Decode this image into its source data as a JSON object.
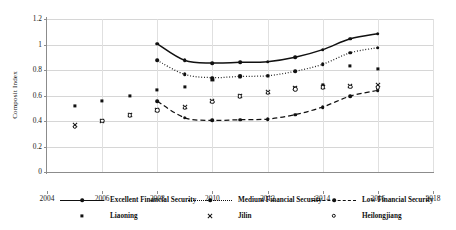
{
  "chart_data": {
    "type": "line",
    "title": "",
    "subtitle": "",
    "xlabel": "",
    "ylabel": "Composit Index",
    "xlim": [
      2004,
      2018
    ],
    "ylim": [
      0,
      1.2
    ],
    "xticks": [
      "2004",
      "2006",
      "2008",
      "2010",
      "2012",
      "2014",
      "2016",
      "2018"
    ],
    "yticks": [
      "0",
      "0.2",
      "0.4",
      "0.6",
      "0.8",
      "1",
      "1.2"
    ],
    "grid": "horizontal-and-vertical",
    "legend_position": "bottom",
    "x": [
      2005,
      2006,
      2007,
      2008,
      2009,
      2010,
      2011,
      2012,
      2013,
      2014,
      2015,
      2016
    ],
    "series": [
      {
        "name": "Excellent Financial Security",
        "marker": "filled-circle",
        "line": "solid",
        "x": [
          2008,
          2009,
          2010,
          2011,
          2012,
          2013,
          2014,
          2015,
          2016
        ],
        "values": [
          1.005,
          0.875,
          0.855,
          0.86,
          0.865,
          0.9,
          0.96,
          1.045,
          1.085
        ]
      },
      {
        "name": "Medium Financial Security",
        "marker": "filled-circle",
        "line": "dotted",
        "x": [
          2008,
          2009,
          2010,
          2011,
          2012,
          2013,
          2014,
          2015,
          2016
        ],
        "values": [
          0.875,
          0.765,
          0.74,
          0.75,
          0.755,
          0.79,
          0.845,
          0.935,
          0.975
        ]
      },
      {
        "name": "Low Financial Security",
        "marker": "filled-circle",
        "line": "dashed",
        "x": [
          2008,
          2009,
          2010,
          2011,
          2012,
          2013,
          2014,
          2015,
          2016
        ],
        "values": [
          0.555,
          0.425,
          0.405,
          0.41,
          0.415,
          0.45,
          0.51,
          0.595,
          0.64
        ]
      },
      {
        "name": "Liaoning",
        "marker": "filled-square",
        "line": "none",
        "x": [
          2005,
          2006,
          2007,
          2008,
          2009,
          2010,
          2011,
          2012,
          2013,
          2014,
          2015,
          2016
        ],
        "values": [
          0.52,
          0.555,
          0.6,
          0.645,
          0.67,
          0.72,
          0.75,
          0.755,
          0.655,
          0.685,
          0.835,
          0.81
        ]
      },
      {
        "name": "Jilin",
        "marker": "x",
        "line": "none",
        "x": [
          2005,
          2006,
          2007,
          2008,
          2009,
          2010,
          2011,
          2012,
          2013,
          2014,
          2015,
          2016
        ],
        "values": [
          0.365,
          0.4,
          0.45,
          0.49,
          0.51,
          0.56,
          0.6,
          0.625,
          0.655,
          0.67,
          0.675,
          0.68
        ]
      },
      {
        "name": "Heilongjiang",
        "marker": "open-circle",
        "line": "none",
        "x": [
          2005,
          2006,
          2007,
          2008,
          2009,
          2010,
          2011,
          2012,
          2013,
          2014,
          2015,
          2016
        ],
        "values": [
          0.355,
          0.4,
          0.445,
          0.485,
          0.505,
          0.55,
          0.595,
          0.62,
          0.65,
          0.665,
          0.67,
          0.665
        ]
      }
    ],
    "legend": [
      {
        "label": "Excellent Financial Security",
        "key": "line-solid-dot"
      },
      {
        "label": "Medium Financial Security",
        "key": "line-dotted-dot"
      },
      {
        "label": "Low Financial Security",
        "key": "line-dashed-dot"
      },
      {
        "label": "Liaoning",
        "key": "marker-square"
      },
      {
        "label": "Jilin",
        "key": "marker-x"
      },
      {
        "label": "Heilongjiang",
        "key": "marker-open-circle"
      }
    ],
    "colors": {
      "series": "#111111",
      "grid": "#d6d6d6",
      "axis": "#8c8c8c"
    }
  }
}
